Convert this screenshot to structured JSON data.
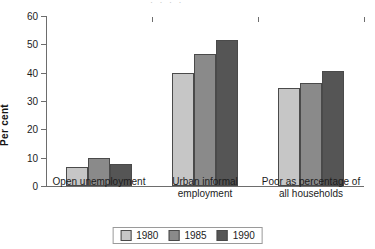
{
  "figure": {
    "scan_artifact_text": "· ·   ·     ·"
  },
  "chart_data": {
    "type": "bar",
    "title": "",
    "xlabel": "",
    "ylabel": "Per cent",
    "ylim": [
      0,
      60
    ],
    "ytick_labels": [
      "0",
      "10",
      "20",
      "30",
      "40",
      "50",
      "60"
    ],
    "ytick_values": [
      0,
      10,
      20,
      30,
      40,
      50,
      60
    ],
    "grid": false,
    "legend_position": "bottom-center",
    "categories": [
      "Open unemployment",
      "Urban informal employment",
      "Poor as percentage of all households"
    ],
    "category_lines": [
      [
        "Open unemployment"
      ],
      [
        "Urban informal",
        "employment"
      ],
      [
        "Poor as percentage of",
        "all households"
      ]
    ],
    "series": [
      {
        "name": "1980",
        "color": "#c6c6c6",
        "values": [
          6.7,
          40.0,
          34.5
        ]
      },
      {
        "name": "1985",
        "color": "#8a8a8a",
        "values": [
          10.0,
          46.5,
          36.5
        ]
      },
      {
        "name": "1990",
        "color": "#555555",
        "values": [
          7.8,
          51.5,
          40.5
        ]
      }
    ]
  }
}
